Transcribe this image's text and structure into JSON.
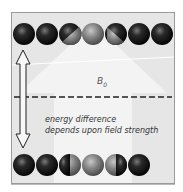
{
  "diagram": {
    "field_label": "B",
    "field_subscript": "0",
    "caption_line1": "energy difference",
    "caption_line2": "depends upon field strength",
    "top_row": {
      "count": 7,
      "states": [
        "dark",
        "dark",
        "half",
        "light",
        "half",
        "dark",
        "dark"
      ]
    },
    "bottom_row": {
      "count": 6,
      "states": [
        "dark",
        "dark",
        "half",
        "light",
        "half",
        "dark"
      ]
    },
    "colors": {
      "background": "#e6e6e6",
      "arrow": "#f2f2f2",
      "dark_sphere": "#1a1a1a",
      "light_sphere": "#8a8a8a",
      "dashed_line": "#222222"
    },
    "icons": {
      "field_arrow": "big-up-arrow-icon",
      "energy_arrow": "double-vertical-arrow-icon"
    }
  }
}
